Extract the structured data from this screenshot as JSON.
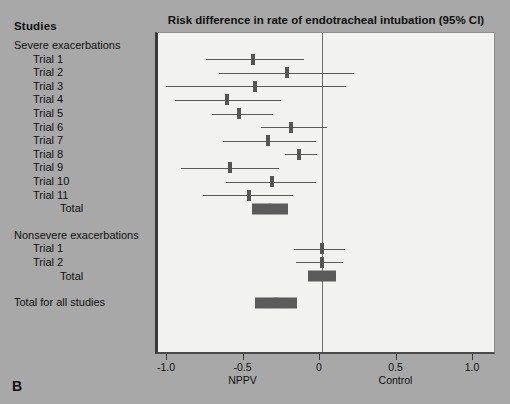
{
  "panel": {
    "letter": "B"
  },
  "header": {
    "studies_label": "Studies"
  },
  "chart_data": {
    "type": "forest",
    "title": "Risk difference in rate of endotracheal intubation (95% CI)",
    "xlabel": "",
    "ylabel": "",
    "xlim": [
      -1.0,
      1.0
    ],
    "xticks": [
      -1.0,
      -0.5,
      0,
      0.5,
      1.0
    ],
    "xtick_labels": [
      "-1.0",
      "-0.5",
      "0",
      "0.5",
      "1.0"
    ],
    "grid": false,
    "legend": "none",
    "null_line": 0,
    "arm_labels": [
      {
        "text": "NPPV",
        "x": -0.5
      },
      {
        "text": "Control",
        "x": 0.5
      }
    ],
    "groups": [
      {
        "name": "Severe exacerbations",
        "rows": [
          {
            "label": "Trial 1",
            "type": "study",
            "estimate": -0.45,
            "ci_low": -0.76,
            "ci_high": -0.12
          },
          {
            "label": "Trial 2",
            "type": "study",
            "estimate": -0.23,
            "ci_low": -0.67,
            "ci_high": 0.21
          },
          {
            "label": "Trial 3",
            "type": "study",
            "estimate": -0.44,
            "ci_low": -1.02,
            "ci_high": 0.16
          },
          {
            "label": "Trial 4",
            "type": "study",
            "estimate": -0.62,
            "ci_low": -0.96,
            "ci_high": -0.27
          },
          {
            "label": "Trial 5",
            "type": "study",
            "estimate": -0.54,
            "ci_low": -0.72,
            "ci_high": -0.32
          },
          {
            "label": "Trial 6",
            "type": "study",
            "estimate": -0.2,
            "ci_low": -0.4,
            "ci_high": 0.03
          },
          {
            "label": "Trial 7",
            "type": "study",
            "estimate": -0.35,
            "ci_low": -0.65,
            "ci_high": -0.04
          },
          {
            "label": "Trial 8",
            "type": "study",
            "estimate": -0.15,
            "ci_low": -0.24,
            "ci_high": -0.03
          },
          {
            "label": "Trial 9",
            "type": "study",
            "estimate": -0.6,
            "ci_low": -0.92,
            "ci_high": -0.28
          },
          {
            "label": "Trial 10",
            "type": "study",
            "estimate": -0.33,
            "ci_low": -0.63,
            "ci_high": -0.04
          },
          {
            "label": "Trial 11",
            "type": "study",
            "estimate": -0.48,
            "ci_low": -0.78,
            "ci_high": -0.19
          },
          {
            "label": "Total",
            "type": "summary",
            "estimate": -0.34,
            "ci_low": -0.46,
            "ci_high": -0.22
          }
        ]
      },
      {
        "name": "Nonsevere exacerbations",
        "rows": [
          {
            "label": "Trial 1",
            "type": "study",
            "estimate": 0.0,
            "ci_low": -0.18,
            "ci_high": 0.15
          },
          {
            "label": "Trial 2",
            "type": "study",
            "estimate": 0.0,
            "ci_low": -0.17,
            "ci_high": 0.14
          },
          {
            "label": "Total",
            "type": "summary",
            "estimate": 0.0,
            "ci_low": -0.09,
            "ci_high": 0.09
          }
        ]
      }
    ],
    "overall": {
      "label": "Total for all studies",
      "type": "summary",
      "estimate": -0.3,
      "ci_low": -0.44,
      "ci_high": -0.17
    }
  }
}
